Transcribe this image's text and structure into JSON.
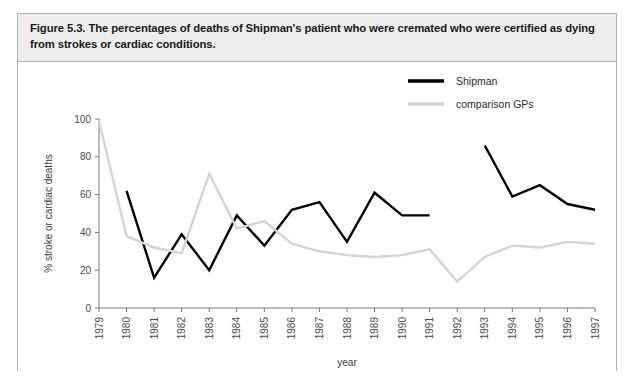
{
  "figure": {
    "caption": "Figure 5.3. The percentages of deaths of Shipman's patient who were cremated who were certified as dying from strokes or cardiac conditions.",
    "frame_border_color": "#b4b4b4",
    "caption_background": "#eeeeee"
  },
  "chart_data": {
    "type": "line",
    "title": "",
    "xlabel": "year",
    "ylabel": "% stroke or cardiac deaths",
    "x": [
      1979,
      1980,
      1981,
      1982,
      1983,
      1984,
      1985,
      1986,
      1987,
      1988,
      1989,
      1990,
      1991,
      1992,
      1993,
      1994,
      1995,
      1996,
      1997
    ],
    "categories": [
      "1979",
      "1980",
      "1981",
      "1982",
      "1983",
      "1984",
      "1985",
      "1986",
      "1987",
      "1988",
      "1989",
      "1990",
      "1991",
      "1992",
      "1993",
      "1994",
      "1995",
      "1996",
      "1997"
    ],
    "xlim": [
      1979,
      1997
    ],
    "ylim": [
      0,
      100
    ],
    "yticks": [
      0,
      20,
      40,
      60,
      80,
      100
    ],
    "ytick_labels": [
      "0",
      "20",
      "40",
      "60",
      "80",
      "100"
    ],
    "grid": false,
    "legend_position": "top-right",
    "series": [
      {
        "name": "Shipman",
        "color": "#000000",
        "line_width": 2.4,
        "values": [
          null,
          62,
          16,
          39,
          20,
          49,
          33,
          52,
          56,
          35,
          61,
          49,
          49,
          null,
          86,
          59,
          65,
          55,
          52
        ]
      },
      {
        "name": "comparison GPs",
        "color": "#d4d4d4",
        "line_width": 2.4,
        "values": [
          99,
          38,
          32,
          29,
          71,
          42,
          46,
          34,
          30,
          28,
          27,
          28,
          31,
          14,
          27,
          33,
          32,
          35,
          34
        ]
      }
    ]
  }
}
